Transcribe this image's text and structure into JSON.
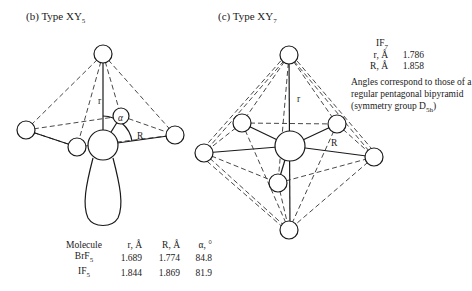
{
  "panel_b": {
    "label": "(b) Type XY",
    "label_subscript": "5",
    "diagram_labels": {
      "r": "r",
      "R": "R",
      "alpha": "α"
    },
    "table": {
      "headers": [
        "Molecule",
        "r, Å",
        "R, Å",
        "α, °"
      ],
      "rows": [
        {
          "molecule": "BrF",
          "molecule_subscript": "5",
          "r": "1.689",
          "R": "1.774",
          "alpha": "84.8"
        },
        {
          "molecule": "IF",
          "molecule_subscript": "5",
          "r": "1.844",
          "R": "1.869",
          "alpha": "81.9"
        }
      ]
    }
  },
  "panel_c": {
    "label": "(c) Type XY",
    "label_subscript": "7",
    "diagram_labels": {
      "r": "r",
      "R": "R"
    },
    "molecule": "IF",
    "molecule_subscript": "7",
    "params": [
      {
        "name": "r, Å",
        "value": "1.786"
      },
      {
        "name": "R, Å",
        "value": "1.858"
      }
    ],
    "note": "Angles correspond to those of a regular pentagonal bipyramid (symmetry group D",
    "note_subscript": "5h",
    "note_end": ")"
  }
}
